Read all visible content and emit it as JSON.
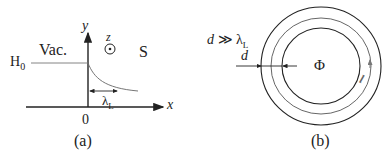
{
  "panel_a": {
    "caption": "(a)",
    "region_left": "Vac.",
    "region_right": "S",
    "field_level": "H",
    "field_level_sub": "0",
    "axis_x": "x",
    "axis_y": "y",
    "axis_z": "z",
    "origin": "0",
    "penetration_depth": "λ",
    "penetration_depth_sub": "L"
  },
  "panel_b": {
    "caption": "(b)",
    "condition_d": "d",
    "condition_op": "≫",
    "condition_lambda": "λ",
    "condition_lambda_sub": "L",
    "thickness_label": "d",
    "flux_label": "Φ",
    "path_label": "l"
  },
  "colors": {
    "line": "#222222",
    "curve": "#666666",
    "path_arrow": "#777777"
  }
}
